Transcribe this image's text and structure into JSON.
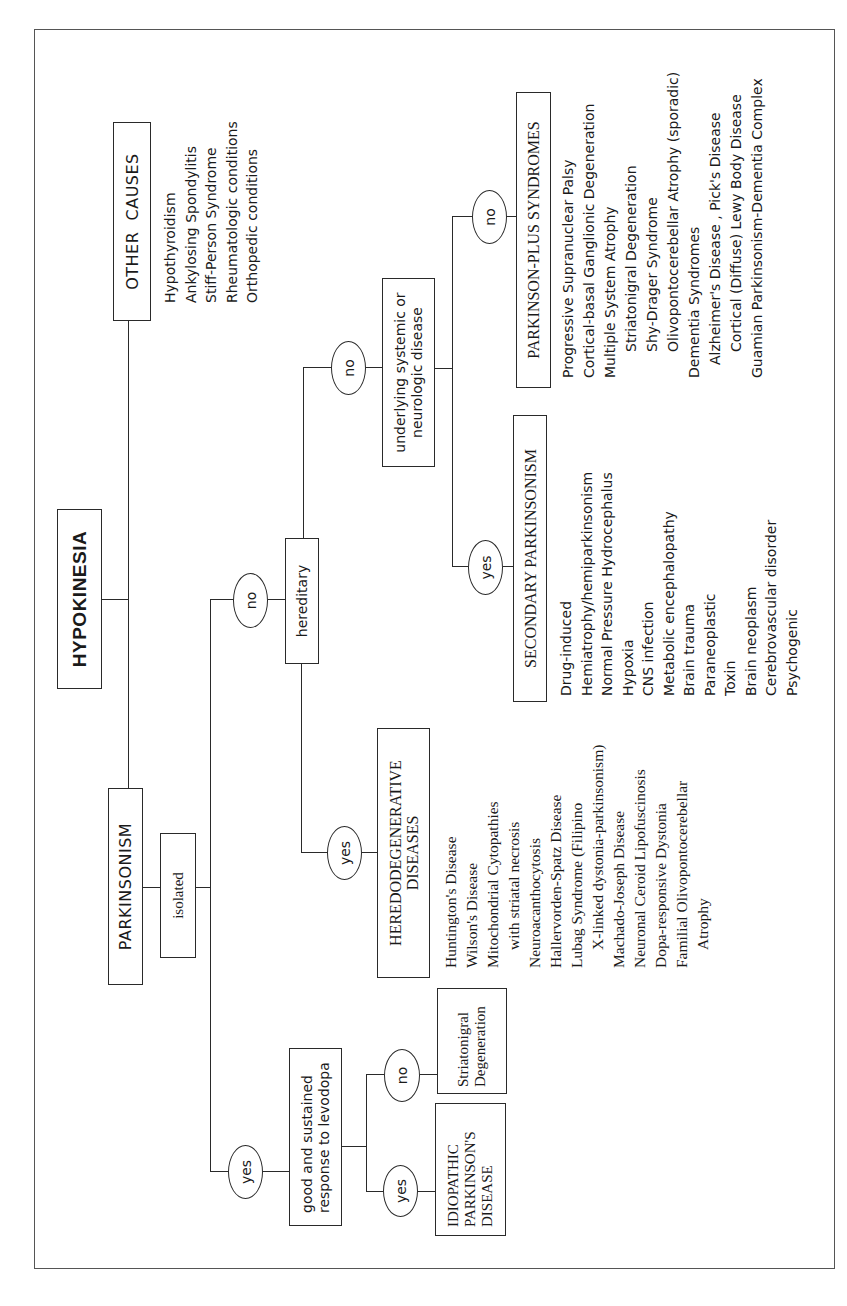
{
  "root": {
    "label": "HYPOKINESIA"
  },
  "other_causes": {
    "label": "OTHER  CAUSES",
    "items": [
      {
        "text": "Hypothyroidism",
        "indent": 0
      },
      {
        "text": "Ankylosing Spondylitis",
        "indent": 0
      },
      {
        "text": "Stiff-Person Syndrome",
        "indent": 0
      },
      {
        "text": "Rheumatologic conditions",
        "indent": 0
      },
      {
        "text": "Orthopedic conditions",
        "indent": 0
      }
    ]
  },
  "parkinsonism": {
    "label": "PARKINSONISM"
  },
  "isolated": {
    "label": "isolated"
  },
  "branch_isolated": {
    "yes_label": "yes",
    "no_label": "no"
  },
  "levodopa": {
    "label": "good and sustained response to levodopa",
    "yes_label": "yes",
    "no_label": "no",
    "yes_result": "IDIOPATHIC PARKINSON'S DISEASE",
    "no_result": "Striatonigral Degeneration"
  },
  "hereditary": {
    "label": "hereditary",
    "yes_label": "yes",
    "no_label": "no"
  },
  "heredodegenerative": {
    "label": "HEREDODEGENERATIVE DISEASES",
    "items": [
      {
        "text": "Huntington's Disease",
        "indent": 0
      },
      {
        "text": "Wilson's Disease",
        "indent": 0
      },
      {
        "text": "Mitochondrial Cytopathies",
        "indent": 0
      },
      {
        "text": "with striatal necrosis",
        "indent": 1
      },
      {
        "text": "Neuroacanthocytosis",
        "indent": 0
      },
      {
        "text": "Hallervorden-Spatz Disease",
        "indent": 0
      },
      {
        "text": "Lubag Syndrome (Filipino",
        "indent": 0
      },
      {
        "text": "X-linked dystonia-parkinsonism)",
        "indent": 1
      },
      {
        "text": "Machado-Joseph Disease",
        "indent": 0
      },
      {
        "text": "Neuronal Ceroid Lipofuscinosis",
        "indent": 0
      },
      {
        "text": "Dopa-responsive Dystonia",
        "indent": 0
      },
      {
        "text": "Familial Olivopontocerebellar",
        "indent": 0
      },
      {
        "text": "Atrophy",
        "indent": 1
      }
    ]
  },
  "underlying": {
    "label": "underlying systemic or neurologic disease",
    "yes_label": "yes",
    "no_label": "no"
  },
  "secondary": {
    "label": "SECONDARY PARKINSONISM",
    "items": [
      {
        "text": "Drug-induced",
        "indent": 0
      },
      {
        "text": "Hemiatrophy/hemiparkinsonism",
        "indent": 0
      },
      {
        "text": "Normal Pressure Hydrocephalus",
        "indent": 0
      },
      {
        "text": "Hypoxia",
        "indent": 0
      },
      {
        "text": "CNS infection",
        "indent": 0
      },
      {
        "text": "Metabolic encephalopathy",
        "indent": 0
      },
      {
        "text": "Brain trauma",
        "indent": 0
      },
      {
        "text": "Paraneoplastic",
        "indent": 0
      },
      {
        "text": "Toxin",
        "indent": 0
      },
      {
        "text": "Brain neoplasm",
        "indent": 0
      },
      {
        "text": "Cerebrovascular disorder",
        "indent": 0
      },
      {
        "text": "Psychogenic",
        "indent": 0
      }
    ]
  },
  "parkinson_plus": {
    "label": "PARKINSON-PLUS SYNDROMES",
    "items": [
      {
        "text": "Progressive Supranuclear Palsy",
        "indent": 0
      },
      {
        "text": "Cortical-basal Ganglionic Degeneration",
        "indent": 0
      },
      {
        "text": "Multiple System Atrophy",
        "indent": 0
      },
      {
        "text": "Striatonigral Degeneration",
        "indent": 2
      },
      {
        "text": "Shy-Drager Syndrome",
        "indent": 2
      },
      {
        "text": "Olivopontocerebellar Atrophy (sporadic)",
        "indent": 2
      },
      {
        "text": "Dementia Syndromes",
        "indent": 0
      },
      {
        "text": "Alzheimer's Disease , Pick's Disease",
        "indent": 1
      },
      {
        "text": "Cortical (Diffuse) Lewy Body Disease",
        "indent": 2
      },
      {
        "text": "Guamian Parkinsonism-Dementia Complex",
        "indent": 0
      }
    ]
  }
}
